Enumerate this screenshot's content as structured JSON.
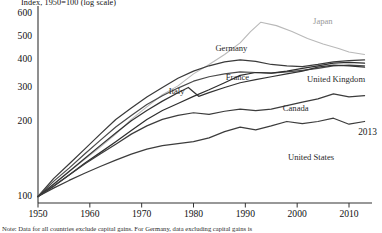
{
  "chart_data": {
    "type": "line",
    "title": "Index, 1950=100 (log scale)",
    "xlabel": "",
    "ylabel": "Index, 1950=100",
    "scale": "log",
    "grid": false,
    "legend_position": "inline-labels",
    "xlim": [
      1950,
      2013
    ],
    "ylim": [
      90,
      640
    ],
    "xticks": [
      1950,
      1960,
      1970,
      1980,
      1990,
      2000,
      2010
    ],
    "yticks": [
      100,
      200,
      300,
      400,
      500,
      600
    ],
    "annotations": [
      {
        "text": "2013",
        "x": 2013,
        "y": 180
      }
    ],
    "note": "Note: Data for all countries exclude capital gains. For Germany, data excluding capital gains is",
    "series": [
      {
        "name": "Japan",
        "color": "#b9b9b9",
        "label_x": 2005,
        "label_y": 560,
        "x": [
          1950,
          1953,
          1956,
          1959,
          1962,
          1965,
          1968,
          1971,
          1974,
          1977,
          1980,
          1983,
          1986,
          1989,
          1991,
          1993,
          1996,
          1999,
          2002,
          2005,
          2008,
          2010,
          2013
        ],
        "values": [
          100,
          112,
          126,
          141,
          158,
          178,
          205,
          238,
          275,
          305,
          345,
          380,
          420,
          470,
          520,
          560,
          545,
          520,
          490,
          465,
          445,
          430,
          420
        ]
      },
      {
        "name": "Germany",
        "color": "#3a3a3a",
        "label_x": 1985,
        "label_y": 445,
        "x": [
          1950,
          1953,
          1956,
          1959,
          1962,
          1965,
          1968,
          1971,
          1974,
          1977,
          1980,
          1983,
          1986,
          1989,
          1992,
          1995,
          1998,
          2001,
          2004,
          2007,
          2010,
          2013
        ],
        "values": [
          100,
          118,
          135,
          155,
          178,
          205,
          235,
          268,
          300,
          330,
          355,
          375,
          390,
          398,
          392,
          380,
          375,
          372,
          380,
          390,
          395,
          398
        ]
      },
      {
        "name": "France",
        "color": "#4a4a4a",
        "label_x": 1987,
        "label_y": 330,
        "x": [
          1950,
          1953,
          1956,
          1959,
          1962,
          1965,
          1968,
          1971,
          1974,
          1977,
          1980,
          1983,
          1986,
          1989,
          1992,
          1995,
          1998,
          2001,
          2004,
          2007,
          2010,
          2013
        ],
        "values": [
          100,
          115,
          130,
          148,
          168,
          190,
          215,
          245,
          272,
          298,
          320,
          335,
          345,
          352,
          350,
          348,
          352,
          358,
          365,
          375,
          378,
          375
        ]
      },
      {
        "name": "United Kingdom",
        "color": "#2e2e2e",
        "label_x": 2005,
        "label_y": 325,
        "x": [
          1950,
          1953,
          1956,
          1959,
          1962,
          1965,
          1968,
          1971,
          1974,
          1977,
          1980,
          1983,
          1986,
          1989,
          1992,
          1995,
          1998,
          2001,
          2004,
          2007,
          2010,
          2013
        ],
        "values": [
          100,
          110,
          122,
          136,
          150,
          166,
          184,
          205,
          228,
          248,
          270,
          292,
          315,
          340,
          350,
          348,
          355,
          365,
          375,
          385,
          388,
          385
        ]
      },
      {
        "name": "Italy",
        "color": "#333333",
        "label_x": 1976,
        "label_y": 285,
        "x": [
          1950,
          1953,
          1956,
          1959,
          1962,
          1965,
          1968,
          1971,
          1974,
          1977,
          1979,
          1981,
          1983,
          1986,
          1989,
          1992,
          1995,
          1998,
          2001,
          2004,
          2007,
          2010,
          2013
        ],
        "values": [
          100,
          112,
          126,
          142,
          160,
          180,
          202,
          228,
          255,
          282,
          300,
          270,
          282,
          300,
          315,
          325,
          335,
          345,
          355,
          370,
          378,
          375,
          370
        ]
      },
      {
        "name": "Canada",
        "color": "#3c3c3c",
        "label_x": 1998,
        "label_y": 232,
        "x": [
          1950,
          1953,
          1956,
          1959,
          1962,
          1965,
          1968,
          1971,
          1974,
          1977,
          1980,
          1983,
          1986,
          1989,
          1992,
          1995,
          1998,
          2001,
          2004,
          2007,
          2010,
          2013
        ],
        "values": [
          100,
          110,
          122,
          135,
          148,
          162,
          178,
          192,
          205,
          215,
          222,
          218,
          226,
          232,
          228,
          232,
          242,
          252,
          262,
          278,
          268,
          272
        ]
      },
      {
        "name": "United States",
        "color": "#3c3c3c",
        "label_x": 1999,
        "label_y": 143,
        "x": [
          1950,
          1953,
          1956,
          1959,
          1962,
          1965,
          1968,
          1971,
          1974,
          1977,
          1980,
          1983,
          1986,
          1989,
          1992,
          1995,
          1998,
          2001,
          2004,
          2007,
          2010,
          2013
        ],
        "values": [
          100,
          108,
          116,
          124,
          132,
          140,
          148,
          155,
          160,
          163,
          166,
          172,
          182,
          190,
          185,
          192,
          200,
          196,
          200,
          208,
          195,
          200
        ]
      }
    ]
  },
  "axis": {
    "y_labels": [
      "600",
      "500",
      "400",
      "300",
      "200",
      "100"
    ],
    "x_labels": [
      "1950",
      "1960",
      "1970",
      "1980",
      "1990",
      "2000",
      "2010"
    ]
  },
  "labels": {
    "japan": "Japan",
    "germany": "Germany",
    "france": "France",
    "united_kingdom": "United Kingdom",
    "italy": "Italy",
    "canada": "Canada",
    "united_states": "United States",
    "endpoint_year": "2013"
  },
  "title": "Index, 1950=100 (log scale)",
  "note": "Note: Data for all countries exclude capital gains. For Germany, data excluding capital gains is"
}
